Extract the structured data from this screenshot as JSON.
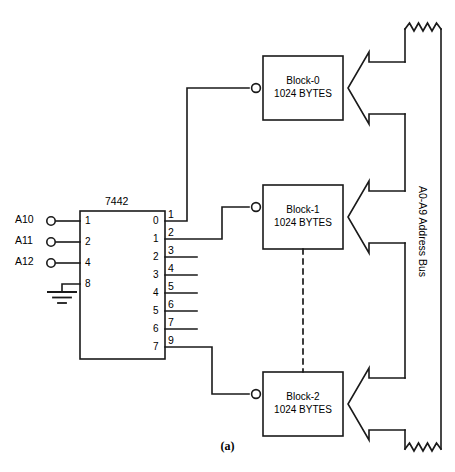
{
  "figure": {
    "caption": "(a)",
    "decoder": {
      "part_number": "7442",
      "inputs": [
        {
          "signal": "A10",
          "pin_weight": "1"
        },
        {
          "signal": "A11",
          "pin_weight": "2"
        },
        {
          "signal": "A12",
          "pin_weight": "4"
        },
        {
          "signal": "GND",
          "pin_weight": "8"
        }
      ],
      "outputs": [
        {
          "output_label": "0",
          "pin_number": "1"
        },
        {
          "output_label": "1",
          "pin_number": "2"
        },
        {
          "output_label": "2",
          "pin_number": "3"
        },
        {
          "output_label": "3",
          "pin_number": "4"
        },
        {
          "output_label": "4",
          "pin_number": "5"
        },
        {
          "output_label": "5",
          "pin_number": "6"
        },
        {
          "output_label": "6",
          "pin_number": "7"
        },
        {
          "output_label": "7",
          "pin_number": "9"
        }
      ]
    },
    "memory_blocks": [
      {
        "name": "Block-0",
        "size": "1024 BYTES"
      },
      {
        "name": "Block-1",
        "size": "1024 BYTES"
      },
      {
        "name": "Block-2",
        "size": "1024 BYTES"
      }
    ],
    "bus": {
      "label": "A0-A9 Address Bus"
    },
    "colors": {
      "line": "#1a1a1a",
      "background": "#ffffff"
    }
  }
}
